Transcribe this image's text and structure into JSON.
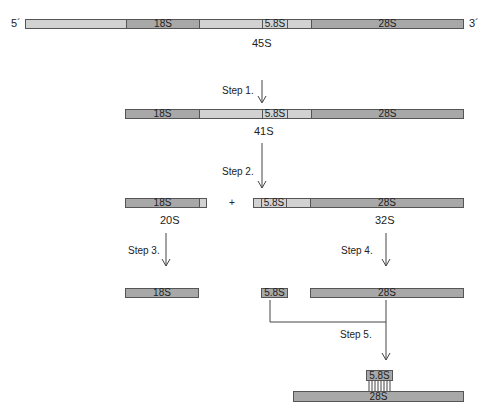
{
  "ends": {
    "five_prime": "5´",
    "three_prime": "3´"
  },
  "rows": {
    "r45": {
      "seg_18s": "18S",
      "seg_58s": "5.8S",
      "seg_28s": "28S",
      "label": "45S"
    },
    "r41": {
      "seg_18s": "18S",
      "seg_58s": "5.8S",
      "seg_28s": "28S",
      "label": "41S"
    },
    "r20": {
      "seg_18s": "18S",
      "label": "20S"
    },
    "plus": "+",
    "r32": {
      "seg_58s": "5.8S",
      "seg_28s": "28S",
      "label": "32S"
    },
    "final": {
      "seg_18s": "18S",
      "seg_58s": "5.8S",
      "seg_28s": "28S"
    },
    "complex": {
      "seg_58s": "5.8S",
      "seg_28s": "28S"
    }
  },
  "steps": [
    "Step 1.",
    "Step 2.",
    "Step 3.",
    "Step 4.",
    "Step 5."
  ],
  "colors": {
    "mature": "#a8a8a8",
    "spacer": "#d2d2d2",
    "outline": "#555555"
  }
}
